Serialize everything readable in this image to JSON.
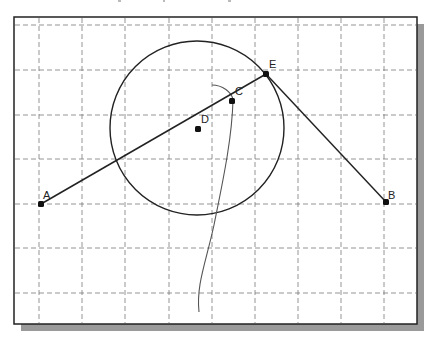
{
  "diagram": {
    "type": "geometry-sketch",
    "frame": {
      "x": 14,
      "y": 17,
      "width": 403,
      "height": 307,
      "border_color": "#222222",
      "background": "#ffffff",
      "shadow_color": "#9a9a9a",
      "shadow_offset": 7
    },
    "grid": {
      "color": "#7a7a7a",
      "dash": "5,3",
      "vertical_x": [
        39,
        82,
        125,
        169,
        212,
        255,
        298,
        341,
        384
      ],
      "horizontal_y": [
        25,
        70,
        115,
        159,
        204,
        248,
        293
      ]
    },
    "points": [
      {
        "id": "A",
        "label": "A",
        "x": 41,
        "y": 204,
        "label_dx": 2,
        "label_dy": -5
      },
      {
        "id": "D",
        "label": "D",
        "x": 198,
        "y": 129,
        "label_dx": 3,
        "label_dy": -6
      },
      {
        "id": "C",
        "label": "C",
        "x": 232,
        "y": 101,
        "label_dx": 3,
        "label_dy": -6
      },
      {
        "id": "E",
        "label": "E",
        "x": 266,
        "y": 74,
        "label_dx": 3,
        "label_dy": -6
      },
      {
        "id": "B",
        "label": "B",
        "x": 386,
        "y": 202,
        "label_dx": 2,
        "label_dy": -3
      }
    ],
    "segments": [
      {
        "from": "A",
        "to": "E"
      },
      {
        "from": "E",
        "to": "B"
      }
    ],
    "circle": {
      "cx": 197,
      "cy": 128,
      "r": 87,
      "color": "#222222"
    },
    "freehand_curve": {
      "color": "#555555",
      "path": "M212,85 C222,85 232,92 233,100 C232,140 222,185 214,225 C206,262 196,285 199,312"
    },
    "colors": {
      "line": "#222222",
      "point": "#111111"
    }
  }
}
